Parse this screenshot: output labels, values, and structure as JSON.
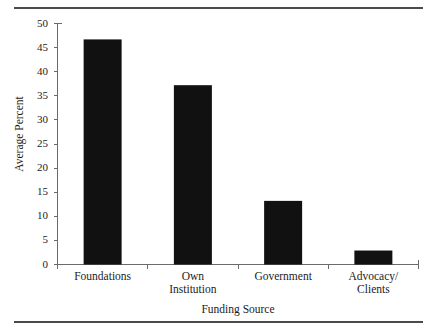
{
  "chart_data": {
    "type": "bar",
    "title": "",
    "subtitle": "",
    "categories": [
      "Foundations",
      "Own\nInstitution",
      "Government",
      "Advocacy/\nClients"
    ],
    "category_labels_flat": [
      "Foundations",
      "Own Institution",
      "Government",
      "Advocacy/ Clients"
    ],
    "values": [
      46.7,
      37.2,
      13.2,
      2.9
    ],
    "xlabel": "Funding Source",
    "ylabel": "Average Percent",
    "ylim": [
      0,
      50
    ],
    "ytick_labels": [
      "0",
      "5",
      "10",
      "15",
      "20",
      "25",
      "30",
      "35",
      "40",
      "45",
      "50"
    ],
    "ytick_values": [
      0,
      5,
      10,
      15,
      20,
      25,
      30,
      35,
      40,
      45,
      50
    ],
    "grid": false,
    "legend": null,
    "legend_position": "none",
    "bar_color": "#111111",
    "axis_color": "#6b6b6b",
    "rule_color": "#4a4a4a",
    "background": "#ffffff",
    "annotations": []
  },
  "figure": {
    "top_rule": "horizontal-rule",
    "bottom_rule": "horizontal-rule"
  }
}
